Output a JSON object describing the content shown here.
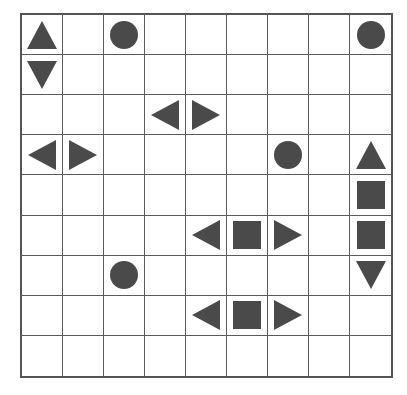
{
  "figure": {
    "grid": {
      "rows": 9,
      "columns": 9,
      "border_color": "#555555",
      "line_color": "#5a5a5a",
      "background_color": "#ffffff",
      "shape_color": "#4a4a4a"
    },
    "shape_names": {
      "triangle-up": "up-triangle",
      "triangle-down": "down-triangle",
      "triangle-left": "left-triangle",
      "triangle-right": "right-triangle",
      "circle": "circle",
      "square": "square",
      "empty": "empty"
    },
    "cells": [
      [
        "triangle-up",
        "empty",
        "circle",
        "empty",
        "empty",
        "empty",
        "empty",
        "empty",
        "circle"
      ],
      [
        "triangle-down",
        "empty",
        "empty",
        "empty",
        "empty",
        "empty",
        "empty",
        "empty",
        "empty"
      ],
      [
        "empty",
        "empty",
        "empty",
        "triangle-left",
        "triangle-right",
        "empty",
        "empty",
        "empty",
        "empty"
      ],
      [
        "triangle-left",
        "triangle-right",
        "empty",
        "empty",
        "empty",
        "empty",
        "circle",
        "empty",
        "triangle-up"
      ],
      [
        "empty",
        "empty",
        "empty",
        "empty",
        "empty",
        "empty",
        "empty",
        "empty",
        "square"
      ],
      [
        "empty",
        "empty",
        "empty",
        "empty",
        "triangle-left",
        "square",
        "triangle-right",
        "empty",
        "square"
      ],
      [
        "empty",
        "empty",
        "circle",
        "empty",
        "empty",
        "empty",
        "empty",
        "empty",
        "triangle-down"
      ],
      [
        "empty",
        "empty",
        "empty",
        "empty",
        "triangle-left",
        "square",
        "triangle-right",
        "empty",
        "empty"
      ],
      [
        "empty",
        "empty",
        "empty",
        "empty",
        "empty",
        "empty",
        "empty",
        "empty",
        "empty"
      ]
    ]
  }
}
